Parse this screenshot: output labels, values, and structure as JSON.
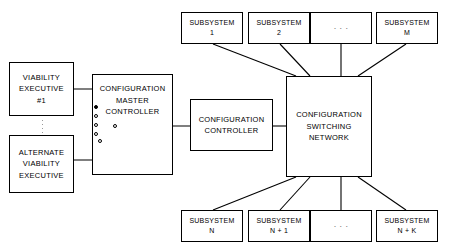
{
  "diagram": {
    "background_color": "#ffffff",
    "line_color": "#000000"
  },
  "executives": {
    "primary": {
      "line1": "VIABILITY",
      "line2": "EXECUTIVE",
      "line3": "#1"
    },
    "alternate": {
      "line1": "ALTERNATE",
      "line2": "VIABILITY",
      "line3": "EXECUTIVE"
    },
    "continuation_marker": "vertical-ellipsis"
  },
  "master_controller": {
    "line1": "CONFIGURATION",
    "line2": "MASTER",
    "line3": "CONTROLLER",
    "switch": {
      "type": "rotary-selector",
      "contact_count": 5,
      "selected_index": 0,
      "selected_source": "VIABILITY EXECUTIVE #1"
    }
  },
  "controller": {
    "line1": "CONFIGURATION",
    "line2": "CONTROLLER"
  },
  "switching_network": {
    "line1": "CONFIGURATION",
    "line2": "SWITCHING",
    "line3": "NETWORK"
  },
  "subsystems": {
    "top_row": [
      {
        "line1": "SUBSYSTEM",
        "line2": "1",
        "is_ellipsis": false
      },
      {
        "line1": "SUBSYSTEM",
        "line2": "2",
        "is_ellipsis": false
      },
      {
        "line1": "· · ·",
        "line2": "",
        "is_ellipsis": true
      },
      {
        "line1": "SUBSYSTEM",
        "line2": "M",
        "is_ellipsis": false
      }
    ],
    "bottom_row": [
      {
        "line1": "SUBSYSTEM",
        "line2": "N",
        "is_ellipsis": false
      },
      {
        "line1": "SUBSYSTEM",
        "line2": "N + 1",
        "is_ellipsis": false
      },
      {
        "line1": "· · ·",
        "line2": "",
        "is_ellipsis": true
      },
      {
        "line1": "SUBSYSTEM",
        "line2": "N + K",
        "is_ellipsis": false
      }
    ]
  }
}
